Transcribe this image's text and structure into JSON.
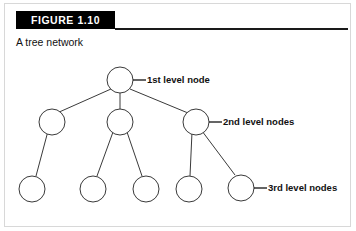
{
  "figure": {
    "number_label": "FIGURE 1.10",
    "caption": "A tree network"
  },
  "annotations": [
    {
      "id": "level-1",
      "text": "1st level node"
    },
    {
      "id": "level-2",
      "text": "2nd level nodes"
    },
    {
      "id": "level-3",
      "text": "3rd level nodes"
    }
  ],
  "diagram": {
    "type": "tree-network",
    "node_count": 10,
    "levels": [
      {
        "level": 1,
        "count": 1
      },
      {
        "level": 2,
        "count": 3
      },
      {
        "level": 3,
        "count": 6
      }
    ]
  },
  "colors": {
    "banner_background": "#000000",
    "banner_text": "#ffffff",
    "rule": "#1a1a1a",
    "node_stroke": "#3a3a3a",
    "node_fill": "#ffffff",
    "text": "#111111",
    "page_background": "#ffffff"
  }
}
